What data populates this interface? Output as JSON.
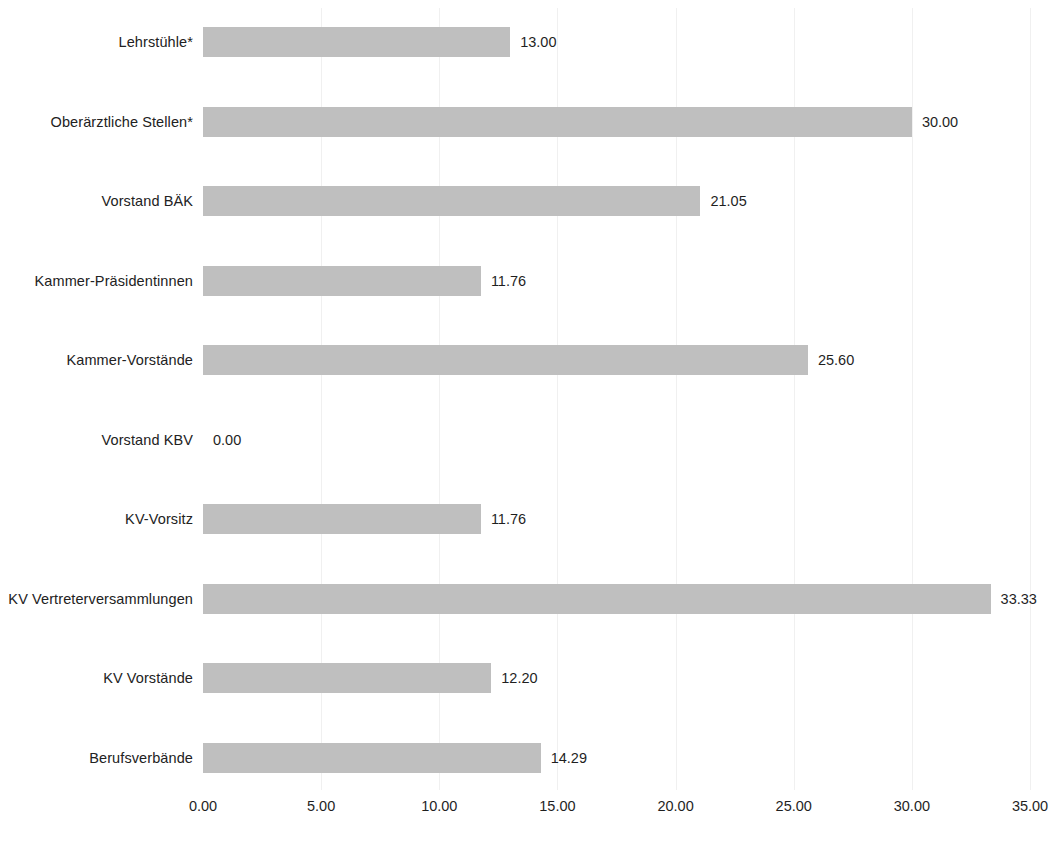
{
  "chart_data": {
    "type": "bar",
    "orientation": "horizontal",
    "title": "",
    "subtitle": "",
    "xlabel": "",
    "ylabel": "",
    "xlim": [
      0,
      35
    ],
    "xtick_step": 5,
    "grid": true,
    "legend": false,
    "legend_position": "none",
    "value_label_format": "0.00",
    "bar_color": "#bfbfbf",
    "text_color": "#1f1f1f",
    "background_color": "#ffffff",
    "gridline_color": "#f0f0f0",
    "categories": [
      "Lehrstühle*",
      "Oberärztliche Stellen*",
      "Vorstand BÄK",
      "Kammer-Präsidentinnen",
      "Kammer-Vorstände",
      "Vorstand KBV",
      "KV-Vorsitz",
      "KV Vertreterversammlungen",
      "KV Vorstände",
      "Berufsverbände"
    ],
    "values": [
      13.0,
      30.0,
      21.05,
      11.76,
      25.6,
      0.0,
      11.76,
      33.33,
      12.2,
      14.29
    ],
    "value_labels": [
      "13.00",
      "30.00",
      "21.05",
      "11.76",
      "25.60",
      "0.00",
      "11.76",
      "33.33",
      "12.20",
      "14.29"
    ],
    "xticks": [
      0,
      5,
      10,
      15,
      20,
      25,
      30,
      35
    ],
    "xtick_labels": [
      "0.00",
      "5.00",
      "10.00",
      "15.00",
      "20.00",
      "25.00",
      "30.00",
      "35.00"
    ]
  },
  "layout": {
    "axis_origin_x": 203,
    "px_per_unit": 23.63,
    "row_height": 30,
    "row_pitch": 79.5,
    "first_row_top": 27,
    "value_label_gap": 10
  }
}
